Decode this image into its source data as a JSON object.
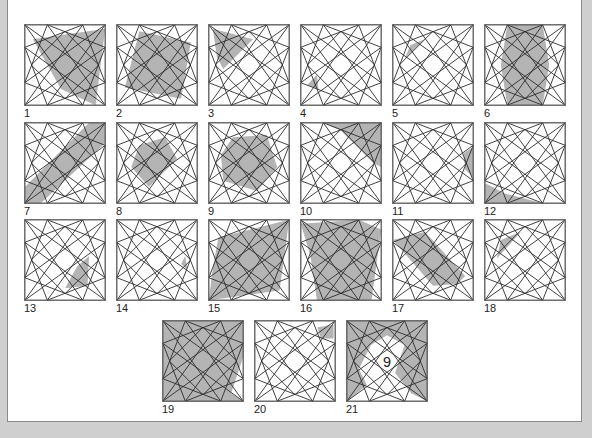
{
  "puzzle": {
    "colors": {
      "shade": "#b4b4b4",
      "line": "#2a2a2a",
      "frame": "#555555",
      "background": "#cfcfcf",
      "panel": "#ffffff"
    },
    "center_number": "9",
    "figures": [
      {
        "label": "1",
        "x": 24,
        "y": 24,
        "shade": "M10,18 L100,5 L88,100 L45,80 Z"
      },
      {
        "label": "2",
        "x": 116,
        "y": 24,
        "shade": "M28,8 L92,22 L80,92 L10,78 Z"
      },
      {
        "label": "3",
        "x": 208,
        "y": 24,
        "shade": "M5,5 L55,18 L18,55 L10,40 Z"
      },
      {
        "label": "4",
        "x": 300,
        "y": 24,
        "shade": "M8,75 L20,62 L22,80 Z"
      },
      {
        "label": "5",
        "x": 392,
        "y": 24,
        "shade": "M22,25 L40,18 L15,42 Z"
      },
      {
        "label": "6",
        "x": 484,
        "y": 24,
        "shade": "M28,0 L72,0 L80,50 L72,100 L28,100 L20,50 Z"
      },
      {
        "label": "7",
        "x": 24,
        "y": 122,
        "shade": "M0,80 L80,0 L100,0 L100,25 L20,100 L0,100 Z"
      },
      {
        "label": "8",
        "x": 116,
        "y": 122,
        "shade": "M28,28 L60,18 L75,45 L40,80 L18,55 Z"
      },
      {
        "label": "9",
        "x": 208,
        "y": 122,
        "shade": "M30,18 L72,15 L85,55 L60,85 L18,72 L15,40 Z"
      },
      {
        "label": "10",
        "x": 300,
        "y": 122,
        "shade": "M28,0 L100,0 L100,55 L90,50 L50,10 Z"
      },
      {
        "label": "11",
        "x": 392,
        "y": 122,
        "shade": "M88,38 L100,30 L100,68 L90,58 Z"
      },
      {
        "label": "12",
        "x": 484,
        "y": 122,
        "shade": "M0,75 L25,88 L72,100 L0,100 Z"
      },
      {
        "label": "13",
        "x": 24,
        "y": 219,
        "shade": "M65,58 L80,45 L78,82 L50,85 Z"
      },
      {
        "label": "14",
        "x": 116,
        "y": 219,
        "shade": "M85,45 L88,62 L80,55 Z"
      },
      {
        "label": "15",
        "x": 208,
        "y": 219,
        "shade": "M12,22 L100,0 L88,88 L0,100 L5,60 Z"
      },
      {
        "label": "16",
        "x": 300,
        "y": 219,
        "shade": "M0,5 L72,0 L100,12 L88,100 L20,100 L12,45 Z"
      },
      {
        "label": "17",
        "x": 392,
        "y": 219,
        "shade": "M0,25 L40,15 L90,70 L80,80 L50,82 Z"
      },
      {
        "label": "18",
        "x": 484,
        "y": 219,
        "shade": "M20,25 L45,15 L15,48 Z"
      },
      {
        "label": "19",
        "x": 162,
        "y": 320,
        "shade": "M0,0 L100,0 L100,45 L85,90 L100,100 L0,100 Z"
      },
      {
        "label": "20",
        "x": 254,
        "y": 320,
        "shade": "M78,8 L98,5 L98,22 L82,22 Z"
      },
      {
        "label": "21",
        "x": 346,
        "y": 320,
        "shade": "M0,0 L100,0 L100,100 L80,90 L60,65 L72,30 L50,18 L30,30 L15,60 L25,80 L0,100 Z"
      }
    ]
  }
}
